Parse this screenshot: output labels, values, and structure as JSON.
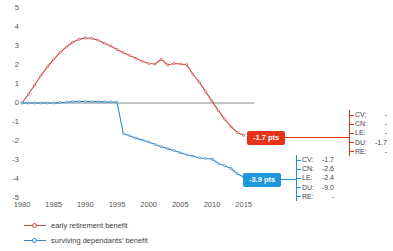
{
  "chart_data": {
    "type": "line",
    "title": "",
    "xlabel": "",
    "ylabel": "",
    "xlim": [
      1980,
      2016
    ],
    "ylim": [
      -5,
      5
    ],
    "grid": false,
    "zero_line": true,
    "legend_position": "bottom-left",
    "xticks": [
      1980,
      1985,
      1990,
      1995,
      2000,
      2005,
      2010,
      2015
    ],
    "yticks": [
      5,
      4,
      3,
      2,
      1,
      0,
      -1,
      -2,
      -3,
      -4,
      -5
    ],
    "series": [
      {
        "name": "early retirement benefit",
        "color": "#c94a3c",
        "end_value": -1.7,
        "x": [
          1980,
          1981,
          1982,
          1983,
          1984,
          1985,
          1986,
          1987,
          1988,
          1989,
          1990,
          1991,
          1992,
          1993,
          1994,
          1995,
          1996,
          1997,
          1998,
          1999,
          2000,
          2001,
          2002,
          2003,
          2004,
          2005,
          2006,
          2007,
          2008,
          2009,
          2010,
          2011,
          2012,
          2013,
          2014,
          2015
        ],
        "values": [
          0.0,
          0.45,
          0.95,
          1.45,
          1.9,
          2.3,
          2.65,
          2.95,
          3.2,
          3.35,
          3.42,
          3.4,
          3.3,
          3.15,
          3.0,
          2.82,
          2.65,
          2.5,
          2.35,
          2.2,
          2.08,
          2.05,
          2.3,
          2.0,
          2.08,
          2.05,
          2.02,
          1.5,
          1.1,
          0.6,
          0.1,
          -0.4,
          -0.85,
          -1.25,
          -1.55,
          -1.7
        ]
      },
      {
        "name": "surviving dependants' benefit",
        "color": "#2f86c5",
        "end_value": -3.9,
        "x": [
          1980,
          1981,
          1982,
          1983,
          1984,
          1985,
          1986,
          1987,
          1988,
          1989,
          1990,
          1991,
          1992,
          1993,
          1994,
          1995,
          1996,
          1997,
          1998,
          1999,
          2000,
          2001,
          2002,
          2003,
          2004,
          2005,
          2006,
          2007,
          2008,
          2009,
          2010,
          2011,
          2012,
          2013,
          2014,
          2015
        ],
        "values": [
          0.0,
          0.0,
          0.0,
          0.0,
          0.0,
          0.0,
          0.02,
          0.04,
          0.07,
          0.08,
          0.08,
          0.07,
          0.07,
          0.06,
          0.05,
          0.04,
          -1.6,
          -1.72,
          -1.85,
          -1.95,
          -2.05,
          -2.18,
          -2.3,
          -2.4,
          -2.5,
          -2.62,
          -2.72,
          -2.8,
          -2.88,
          -2.92,
          -2.95,
          -3.18,
          -3.3,
          -3.45,
          -3.72,
          -3.9
        ]
      }
    ]
  },
  "callouts": {
    "red": {
      "badge_label": "-1.7 pts",
      "color": "#e6331a",
      "breakdown": [
        {
          "key": "CV:",
          "value": "-"
        },
        {
          "key": "CN:",
          "value": "-"
        },
        {
          "key": "LE:",
          "value": "-"
        },
        {
          "key": "DU:",
          "value": "-1.7"
        },
        {
          "key": "RE:",
          "value": "-"
        }
      ]
    },
    "blue": {
      "badge_label": "-3.9 pts",
      "color": "#1d96dc",
      "breakdown": [
        {
          "key": "CV:",
          "value": "-1.7"
        },
        {
          "key": "CN:",
          "value": "-2.6"
        },
        {
          "key": "LE:",
          "value": "-2.4"
        },
        {
          "key": "DU:",
          "value": "-9.0"
        },
        {
          "key": "RE:",
          "value": "-"
        }
      ]
    }
  },
  "legend": {
    "items": [
      {
        "label": "early retirement benefit",
        "color": "#c94a3c"
      },
      {
        "label": "surviving dependants' benefit",
        "color": "#2f86c5"
      }
    ]
  }
}
